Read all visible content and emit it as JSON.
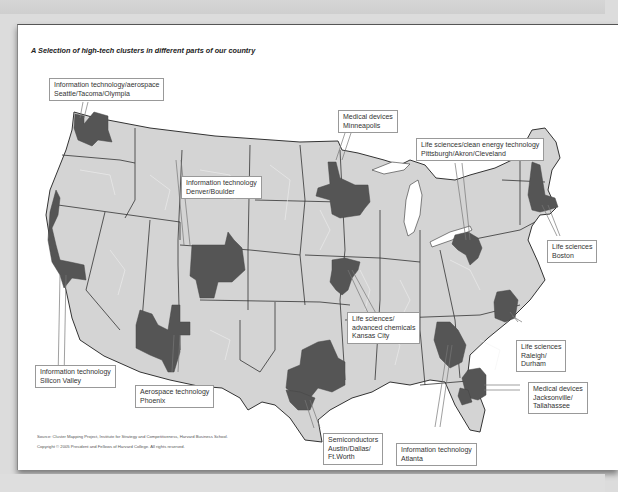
{
  "title": "A Selection of high-tech clusters in different parts of our country",
  "colors": {
    "land": "#d4d4d4",
    "cluster": "#555555",
    "state_border": "#333333",
    "county_border": "#f2f2f2",
    "background": "#ffffff"
  },
  "clusters": [
    {
      "id": "seattle",
      "industry": "Information technology/aerospace",
      "location": "Seattle/Tacoma/Olympia"
    },
    {
      "id": "minneapolis",
      "industry": "Medical devices",
      "location": "Minneapolis"
    },
    {
      "id": "pittsburgh",
      "industry": "Life sciences/clean energy technology",
      "location": "Pittsburgh/Akron/Cleveland"
    },
    {
      "id": "denver",
      "industry": "Information technology",
      "location": "Denver/Boulder"
    },
    {
      "id": "boston",
      "industry": "Life sciences",
      "location": "Boston"
    },
    {
      "id": "kansas-city",
      "industry": "Life sciences/",
      "industry2": "advanced chemicals",
      "location": "Kansas City"
    },
    {
      "id": "raleigh",
      "industry": "Life sciences",
      "location": "Raleigh/",
      "location2": "Durham"
    },
    {
      "id": "silicon-valley",
      "industry": "Information technology",
      "location": "Silicon Valley"
    },
    {
      "id": "phoenix",
      "industry": "Aerospace technology",
      "location": "Phoenix"
    },
    {
      "id": "jacksonville",
      "industry": "Medical devices",
      "location": "Jacksonville/",
      "location2": "Tallahassee"
    },
    {
      "id": "austin",
      "industry": "Semiconductors",
      "location": "Austin/Dallas/",
      "location2": "Ft.Worth"
    },
    {
      "id": "atlanta",
      "industry": "Information technology",
      "location": "Atlanta"
    }
  ],
  "source": {
    "line1": "Source: Cluster Mapping Project, Institute for Strategy and Competitiveness, Harvard Business School.",
    "line2": "Copyright © 2005 President and Fellows of Harvard College. All rights reserved."
  }
}
